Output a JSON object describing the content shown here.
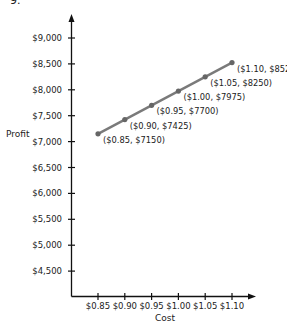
{
  "figure_number": "9.",
  "chart_data": {
    "type": "line",
    "title": "",
    "xlabel": "Cost",
    "ylabel": "Profit",
    "x": [
      0.85,
      0.9,
      0.95,
      1.0,
      1.05,
      1.1
    ],
    "x_tick_labels": [
      "$0.85",
      "$0.90",
      "$0.95",
      "$1.00",
      "$1.05",
      "$1.10"
    ],
    "y_tick_values": [
      9000,
      8500,
      8000,
      7500,
      7000,
      6500,
      6000,
      5500,
      5000,
      4500
    ],
    "y_tick_labels": [
      "$9,000",
      "$8,500",
      "$8,000",
      "$7,500",
      "$7,000",
      "$6,500",
      "$6,000",
      "$5,500",
      "$5,000",
      "$4,500"
    ],
    "series": [
      {
        "name": "Profit",
        "values": [
          7150,
          7425,
          7700,
          7975,
          8250,
          8525
        ],
        "point_labels": [
          "($0.85, $7150)",
          "($0.90, $7425)",
          "($0.95, $7700)",
          "($1.00, $7975)",
          "($1.05, $8250)",
          "($1.10, $8525)"
        ],
        "color": "#7a7a7a"
      }
    ],
    "ylim": [
      4000,
      9300
    ],
    "grid": false,
    "legend": null
  }
}
